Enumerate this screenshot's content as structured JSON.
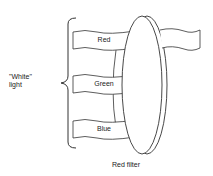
{
  "diagram": {
    "input_label_line1": "\"White\"",
    "input_label_line2": "light",
    "bands": [
      {
        "label": "Red"
      },
      {
        "label": "Green"
      },
      {
        "label": "Blue"
      }
    ],
    "filter_label": "Red filter",
    "transmitted": "Red"
  }
}
